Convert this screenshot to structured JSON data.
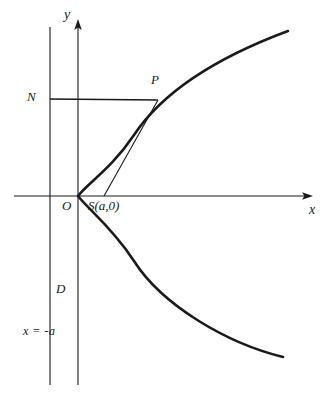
{
  "figure": {
    "type": "geometry-diagram",
    "background_color": "#ffffff",
    "line_color": "#1a1a1a",
    "labels": {
      "y_axis": "y",
      "x_axis": "x",
      "origin": "O",
      "focus": "S(a,0)",
      "point_on_curve": "P",
      "foot_on_directrix": "N",
      "directrix_name": "D",
      "directrix_equation": "x = -a"
    },
    "geometry": {
      "x_axis": {
        "y": 196,
        "x_start": 14,
        "x_end": 312
      },
      "y_axis": {
        "x": 78,
        "y_top": 20,
        "y_bottom": 385
      },
      "directrix": {
        "x": 50,
        "y_top": 27,
        "y_bottom": 385
      },
      "vertex": {
        "x": 78,
        "y": 196
      },
      "focus": {
        "x": 104,
        "y": 196
      },
      "point_p": {
        "x": 158,
        "y": 100
      },
      "point_n": {
        "x": 50,
        "y": 99
      },
      "curve_upper_end": {
        "x": 288,
        "y": 31
      },
      "curve_lower_end": {
        "x": 283,
        "y": 357
      }
    },
    "label_positions": {
      "y_axis": {
        "x": 64,
        "y": 10
      },
      "x_axis": {
        "x": 310,
        "y": 204
      },
      "origin": {
        "x": 63,
        "y": 200
      },
      "focus": {
        "x": 89,
        "y": 200
      },
      "point_on_curve": {
        "x": 152,
        "y": 74
      },
      "foot_on_directrix": {
        "x": 28,
        "y": 91
      },
      "directrix_name": {
        "x": 56,
        "y": 283
      },
      "directrix_equation": {
        "x": 24,
        "y": 326
      }
    }
  }
}
